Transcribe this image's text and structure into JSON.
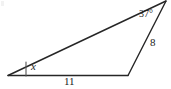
{
  "figure": {
    "type": "geometry-triangle-diagram",
    "stroke_color": "#262626",
    "background_color": "#ffffff",
    "vertices": {
      "left": {
        "x": 8,
        "y": 75
      },
      "bottom_right": {
        "x": 128,
        "y": 75
      },
      "apex": {
        "x": 166,
        "y": 1
      }
    },
    "angles": [
      {
        "name": "angle-x",
        "label": "x",
        "at_vertex": "left",
        "has_tick_mark": true
      },
      {
        "name": "angle-37",
        "label": "37°",
        "at_vertex": "apex",
        "has_tick_mark": false
      }
    ],
    "sides": [
      {
        "name": "side-bottom",
        "label": "11",
        "from": "left",
        "to": "bottom_right"
      },
      {
        "name": "side-right",
        "label": "8",
        "from": "bottom_right",
        "to": "apex"
      },
      {
        "name": "side-hypotenuse",
        "label": "",
        "from": "left",
        "to": "apex"
      }
    ]
  }
}
